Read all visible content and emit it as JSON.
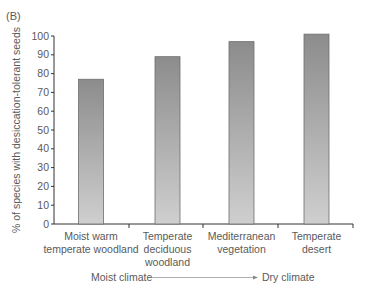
{
  "panel_label": "(B)",
  "chart_data": {
    "type": "bar",
    "title": "",
    "xlabel": "",
    "ylabel": "% of species with desiccation-tolerant seeds",
    "ylim": [
      0,
      100
    ],
    "yticks": [
      0,
      10,
      20,
      30,
      40,
      50,
      60,
      70,
      80,
      90,
      100
    ],
    "grid": false,
    "categories": [
      [
        "Moist warm",
        "temperate woodland"
      ],
      [
        "Temperate",
        "deciduous",
        "woodland"
      ],
      [
        "Mediterranean",
        "vegetation"
      ],
      [
        "Temperate",
        "desert"
      ]
    ],
    "values": [
      77,
      89,
      97,
      101
    ],
    "gradient_annotation": {
      "from": "Moist climate",
      "to": "Dry climate"
    },
    "bar_color_top": "#8c8c8c",
    "bar_color_bottom": "#cfcfcf",
    "bar_border": "#6e6e6e"
  }
}
